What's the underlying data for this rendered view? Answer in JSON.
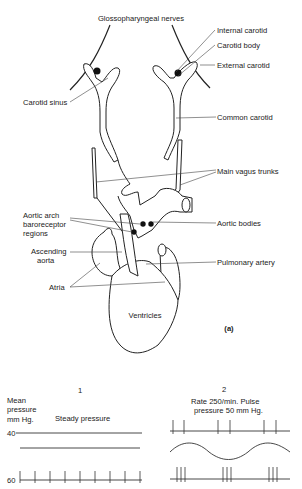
{
  "figure": {
    "panel_label": "(a)",
    "anatomy_labels": {
      "glossopharyngeal": "Glossopharyngeal nerves",
      "internal_carotid": "Internal carotid",
      "carotid_body": "Carotid body",
      "external_carotid": "External carotid",
      "carotid_sinus": "Carotid sinus",
      "common_carotid": "Common carotid",
      "main_vagus": "Main vagus trunks",
      "aortic_arch_1": "Aortic arch",
      "aortic_arch_2": "baroreceptor",
      "aortic_arch_3": "regions",
      "aortic_bodies": "Aortic bodies",
      "ascending_1": "Ascending",
      "ascending_2": "aorta",
      "pulmonary": "Pulmonary artery",
      "atria": "Atria",
      "ventricles": "Ventricles"
    },
    "traces": {
      "col1_number": "1",
      "col2_number": "2",
      "axis_label_1": "Mean",
      "axis_label_2": "pressure",
      "axis_label_3": "mm  Hg.",
      "steady": "Steady pressure",
      "rate_1": "Rate 250/min. Pulse",
      "rate_2": "pressure  50 mm  Hg.",
      "tick_40": "40",
      "tick_60": "60"
    }
  }
}
